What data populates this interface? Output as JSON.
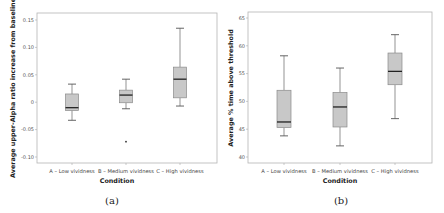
{
  "figure": {
    "panels": [
      "(a)",
      "(b)"
    ]
  },
  "chart_data": [
    {
      "type": "box",
      "caption": "(a)",
      "title": "",
      "xlabel": "Condition",
      "ylabel": "Average upper-Alpha ratio increase from baseline",
      "categories": [
        "A – Low vividness",
        "B – Medium vividness",
        "C – High vividness"
      ],
      "yticks": [
        "0.15",
        "0.10",
        "0.05",
        "0",
        "-0.05",
        "-0.10"
      ],
      "ylim": [
        -0.11,
        0.16
      ],
      "grid": false,
      "series": [
        {
          "name": "A – Low vividness",
          "whisker_low": -0.033,
          "q1": -0.015,
          "median": -0.01,
          "q3": 0.015,
          "whisker_high": 0.033,
          "outliers": []
        },
        {
          "name": "B – Medium vividness",
          "whisker_low": -0.012,
          "q1": -0.001,
          "median": 0.013,
          "q3": 0.022,
          "whisker_high": 0.042,
          "outliers": [
            -0.072
          ]
        },
        {
          "name": "C – High vividness",
          "whisker_low": -0.007,
          "q1": 0.008,
          "median": 0.042,
          "q3": 0.064,
          "whisker_high": 0.135,
          "outliers": []
        }
      ]
    },
    {
      "type": "box",
      "caption": "(b)",
      "title": "",
      "xlabel": "Condition",
      "ylabel": "Average % time above threshold",
      "categories": [
        "A – Low vividness",
        "B – Medium vividness",
        "C – High vividness"
      ],
      "yticks": [
        "65",
        "60",
        "55",
        "50",
        "45",
        "40"
      ],
      "ylim": [
        39,
        66
      ],
      "grid": false,
      "series": [
        {
          "name": "A – Low vividness",
          "whisker_low": 43.8,
          "q1": 45.3,
          "median": 46.3,
          "q3": 52.0,
          "whisker_high": 58.2,
          "outliers": []
        },
        {
          "name": "B – Medium vividness",
          "whisker_low": 42.0,
          "q1": 45.4,
          "median": 49.0,
          "q3": 51.6,
          "whisker_high": 56.0,
          "outliers": []
        },
        {
          "name": "C – High vividness",
          "whisker_low": 46.9,
          "q1": 53.0,
          "median": 55.4,
          "q3": 58.7,
          "whisker_high": 62.0,
          "outliers": []
        }
      ]
    }
  ]
}
